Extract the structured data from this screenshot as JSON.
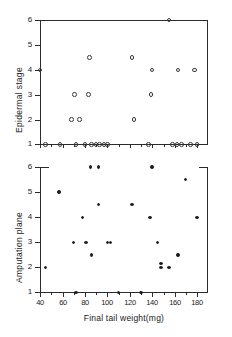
{
  "figure": {
    "background": "#ffffff",
    "ink_color": "#1a1a1a",
    "marker_color": "#3a3a3a"
  },
  "chart_data": [
    {
      "type": "scatter",
      "panel": "top",
      "title": "",
      "xlabel": "",
      "ylabel": "Epidermal stage",
      "xlim": [
        40,
        180
      ],
      "ylim": [
        1,
        6
      ],
      "xticks": [
        40,
        60,
        80,
        100,
        120,
        140,
        160,
        180
      ],
      "xticklabels": [
        "40",
        "60",
        "80",
        "100",
        "120",
        "140",
        "160",
        "180"
      ],
      "yticks": [
        1,
        2,
        3,
        4,
        5,
        6
      ],
      "yticklabels": [
        "1",
        "2",
        "3",
        "4",
        "5",
        "6"
      ],
      "grid": false,
      "legend": null,
      "marker": "open-circle",
      "points": [
        {
          "x": 40,
          "y": 4
        },
        {
          "x": 45,
          "y": 1
        },
        {
          "x": 58,
          "y": 1
        },
        {
          "x": 68,
          "y": 2
        },
        {
          "x": 75,
          "y": 2
        },
        {
          "x": 71,
          "y": 3
        },
        {
          "x": 83,
          "y": 3
        },
        {
          "x": 84,
          "y": 4.5
        },
        {
          "x": 72,
          "y": 1
        },
        {
          "x": 80,
          "y": 1
        },
        {
          "x": 86,
          "y": 1
        },
        {
          "x": 90,
          "y": 1
        },
        {
          "x": 93,
          "y": 1
        },
        {
          "x": 97,
          "y": 1
        },
        {
          "x": 100,
          "y": 1
        },
        {
          "x": 122,
          "y": 4.5
        },
        {
          "x": 124,
          "y": 2
        },
        {
          "x": 139,
          "y": 3
        },
        {
          "x": 140,
          "y": 4
        },
        {
          "x": 137,
          "y": 1
        },
        {
          "x": 155,
          "y": 6
        },
        {
          "x": 163,
          "y": 4
        },
        {
          "x": 178,
          "y": 4
        },
        {
          "x": 158,
          "y": 1
        },
        {
          "x": 162,
          "y": 1
        },
        {
          "x": 166,
          "y": 1
        },
        {
          "x": 174,
          "y": 1
        },
        {
          "x": 180,
          "y": 1
        }
      ]
    },
    {
      "type": "scatter",
      "panel": "bottom",
      "title": "",
      "xlabel": "Final tail weight(mg)",
      "ylabel": "Amputation plane",
      "xlim": [
        40,
        180
      ],
      "ylim": [
        1,
        6
      ],
      "xticks": [
        40,
        60,
        80,
        100,
        120,
        140,
        160,
        180
      ],
      "xticklabels": [
        "40",
        "60",
        "80",
        "100",
        "120",
        "140",
        "160",
        "180"
      ],
      "yticks": [
        1,
        2,
        3,
        4,
        5,
        6
      ],
      "yticklabels": [
        "1",
        "2",
        "3",
        "4",
        "5",
        "6"
      ],
      "grid": false,
      "legend": null,
      "marker": "filled-circle",
      "points": [
        {
          "x": 45,
          "y": 2
        },
        {
          "x": 57,
          "y": 5
        },
        {
          "x": 70,
          "y": 3
        },
        {
          "x": 72,
          "y": 1
        },
        {
          "x": 78,
          "y": 4
        },
        {
          "x": 81,
          "y": 3
        },
        {
          "x": 85,
          "y": 6
        },
        {
          "x": 86,
          "y": 2.5
        },
        {
          "x": 92,
          "y": 6
        },
        {
          "x": 92,
          "y": 4.5
        },
        {
          "x": 100,
          "y": 3
        },
        {
          "x": 103,
          "y": 3
        },
        {
          "x": 110,
          "y": 1
        },
        {
          "x": 122,
          "y": 4.5
        },
        {
          "x": 130,
          "y": 1
        },
        {
          "x": 140,
          "y": 6
        },
        {
          "x": 138,
          "y": 4
        },
        {
          "x": 145,
          "y": 3
        },
        {
          "x": 148,
          "y": 2
        },
        {
          "x": 148,
          "y": 2.15
        },
        {
          "x": 155,
          "y": 2
        },
        {
          "x": 163,
          "y": 2.5
        },
        {
          "x": 170,
          "y": 5.5
        },
        {
          "x": 180,
          "y": 4
        }
      ]
    }
  ]
}
